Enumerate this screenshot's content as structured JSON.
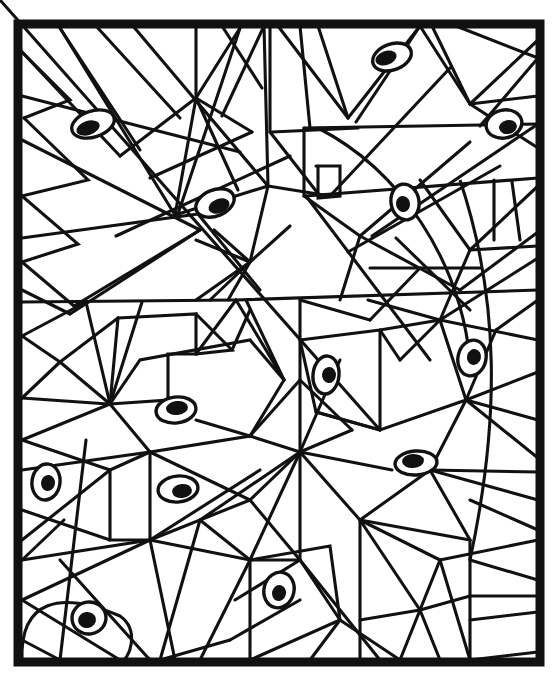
{
  "artwork": {
    "title": "Abstract geometric mosaic coloring page with eyes",
    "style": "black-and-white line drawing",
    "background_color": "#ffffff",
    "ink_color": "#111111",
    "canvas": {
      "width": 559,
      "height": 686
    },
    "frame": {
      "x": 18,
      "y": 24,
      "width": 522,
      "height": 638,
      "stroke_width": 9
    },
    "motif_count_label": "14 eyes",
    "eyes": [
      {
        "name": "eye-top-left",
        "cx": 93,
        "cy": 124,
        "rx": 22,
        "ry": 13,
        "rot": -18,
        "px": -5,
        "py": 4,
        "prx": 12,
        "pry": 7,
        "prot": -18
      },
      {
        "name": "eye-top-center-right",
        "cx": 392,
        "cy": 57,
        "rx": 20,
        "ry": 13,
        "rot": -20,
        "px": -6,
        "py": 1,
        "prx": 11,
        "pry": 7,
        "prot": -20
      },
      {
        "name": "eye-top-right",
        "cx": 504,
        "cy": 124,
        "rx": 18,
        "ry": 14,
        "rot": -12,
        "px": 4,
        "py": 3,
        "prx": 9,
        "pry": 7,
        "prot": -12
      },
      {
        "name": "eye-upper-mid-left",
        "cx": 215,
        "cy": 203,
        "rx": 20,
        "ry": 13,
        "rot": -22,
        "px": 4,
        "py": 3,
        "prx": 11,
        "pry": 7,
        "prot": -22
      },
      {
        "name": "eye-upper-mid-right",
        "cx": 405,
        "cy": 202,
        "rx": 14,
        "ry": 18,
        "rot": -10,
        "px": -2,
        "py": 2,
        "prx": 7,
        "pry": 8,
        "prot": -10
      },
      {
        "name": "eye-center-right",
        "cx": 472,
        "cy": 358,
        "rx": 14,
        "ry": 18,
        "rot": 12,
        "px": 2,
        "py": -1,
        "prx": 7,
        "pry": 8,
        "prot": 12
      },
      {
        "name": "eye-center",
        "cx": 326,
        "cy": 375,
        "rx": 13,
        "ry": 19,
        "rot": 6,
        "px": 3,
        "py": 0,
        "prx": 7,
        "pry": 8,
        "prot": 6
      },
      {
        "name": "eye-mid-left",
        "cx": 176,
        "cy": 410,
        "rx": 20,
        "ry": 13,
        "rot": -7,
        "px": 1,
        "py": -2,
        "prx": 11,
        "pry": 7,
        "prot": -7
      },
      {
        "name": "eye-lower-right",
        "cx": 416,
        "cy": 463,
        "rx": 21,
        "ry": 12,
        "rot": -4,
        "px": -3,
        "py": -2,
        "prx": 11,
        "pry": 7,
        "prot": -4
      },
      {
        "name": "eye-left-edge",
        "cx": 46,
        "cy": 482,
        "rx": 14,
        "ry": 18,
        "rot": 8,
        "px": 2,
        "py": 1,
        "prx": 7,
        "pry": 8,
        "prot": 8
      },
      {
        "name": "eye-lower-mid-left",
        "cx": 178,
        "cy": 489,
        "rx": 20,
        "ry": 13,
        "rot": -6,
        "px": 4,
        "py": 2,
        "prx": 10,
        "pry": 7,
        "prot": -6
      },
      {
        "name": "eye-bottom-center",
        "cx": 279,
        "cy": 590,
        "rx": 15,
        "ry": 18,
        "rot": 14,
        "px": 0,
        "py": 3,
        "prx": 7,
        "pry": 8,
        "prot": 14
      },
      {
        "name": "eye-bottom-left",
        "cx": 89,
        "cy": 618,
        "rx": 17,
        "ry": 16,
        "rot": -8,
        "px": -2,
        "py": 2,
        "prx": 9,
        "pry": 8,
        "prot": -8
      },
      {
        "name": "eye-right-lower",
        "cx": 360,
        "cy": 493,
        "rx": 0,
        "ry": 0,
        "rot": 0,
        "px": 0,
        "py": 0,
        "prx": 0,
        "pry": 0,
        "prot": 0
      }
    ]
  }
}
